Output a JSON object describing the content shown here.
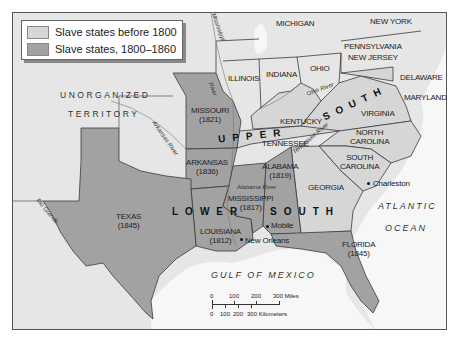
{
  "legend": {
    "items": [
      {
        "label": "Slave states before 1800",
        "color": "#d6d6d6"
      },
      {
        "label": "Slave states, 1800–1860",
        "color": "#a2a2a2"
      }
    ]
  },
  "colors": {
    "free_land": "#ececec",
    "territory": "#e4e4e4",
    "slave_before_1800": "#d6d6d6",
    "slave_1800_1860": "#a2a2a2",
    "water": "#f7f7f7",
    "border": "#3a3a3a"
  },
  "states": {
    "michigan": "MICHIGAN",
    "new_york": "NEW YORK",
    "pennsylvania": "PENNSYLVANIA",
    "new_jersey": "NEW JERSEY",
    "delaware": "DELAWARE",
    "maryland": "MARYLAND",
    "illinois": "ILLINOIS",
    "indiana": "INDIANA",
    "ohio": "OHIO",
    "kentucky": "KENTUCKY",
    "virginia": "VIRGINIA",
    "tennessee": "TENNESSEE",
    "north_carolina": "NORTH\nCAROLINA",
    "south_carolina": "SOUTH\nCAROLINA",
    "georgia": "GEORGIA",
    "missouri": {
      "name": "MISSOURI",
      "year": "(1821)"
    },
    "arkansas": {
      "name": "ARKANSAS",
      "year": "(1836)"
    },
    "alabama": {
      "name": "ALABAMA",
      "year": "(1819)"
    },
    "mississippi": {
      "name": "MISSISSIPPI",
      "year": "(1817)"
    },
    "louisiana": {
      "name": "LOUISIANA",
      "year": "(1812)"
    },
    "texas": {
      "name": "TEXAS",
      "year": "(1845)"
    },
    "florida": {
      "name": "FLORIDA",
      "year": "(1845)"
    }
  },
  "regions": {
    "upper_south_1": "UPPER",
    "upper_south_2": "SOUTH",
    "lower_south_1": "LOWER",
    "lower_south_2": "SOUTH"
  },
  "territory": {
    "line1": "UNORGANIZED",
    "line2": "TERRITORY"
  },
  "water": {
    "atlantic_1": "ATLANTIC",
    "atlantic_2": "OCEAN",
    "gulf": "GULF OF MEXICO"
  },
  "rivers": {
    "mississippi": "Mississippi",
    "missouri": "River",
    "arkansas": "Arkansas River",
    "ohio": "Ohio River",
    "tennessee": "Tennessee River",
    "alabama": "Alabama River",
    "rio_grande": "Rio Grande"
  },
  "cities": {
    "charleston": "Charleston",
    "mobile": "Mobile",
    "new_orleans": "New Orleans"
  },
  "scale": {
    "miles_ticks": [
      "0",
      "100",
      "200",
      "300 Miles"
    ],
    "km_ticks": [
      "0",
      "100",
      "200",
      "300 Kilometers"
    ]
  }
}
